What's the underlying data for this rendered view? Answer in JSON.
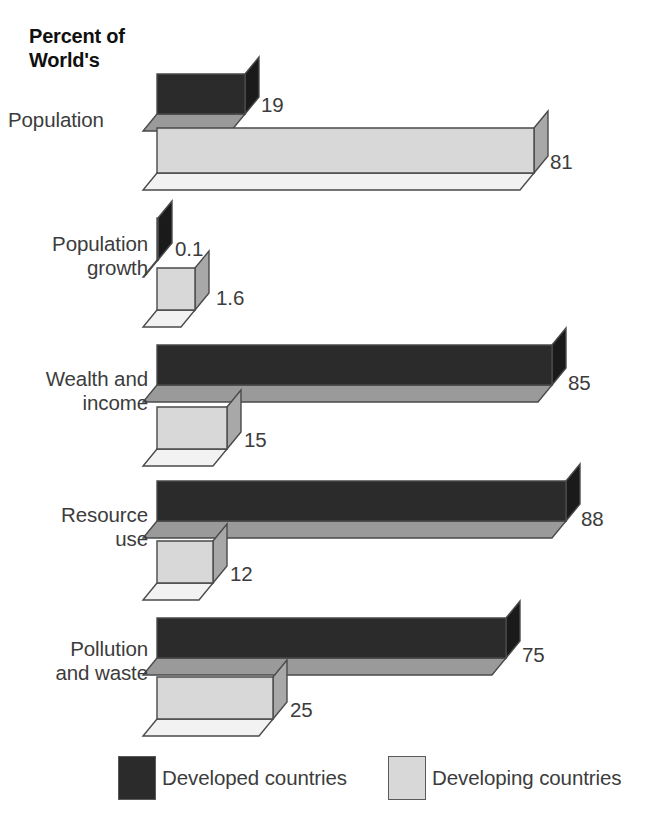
{
  "title": "Percent of\nWorld's",
  "colors": {
    "developed_front": "#2b2b2b",
    "developed_side": "#1a1a1a",
    "developed_bottom": "#9a9a9a",
    "developing_front": "#d8d8d8",
    "developing_side": "#a8a8a8",
    "developing_bottom": "#f2f2f2",
    "outline": "#4a4a4a",
    "text": "#3c3c3c",
    "background": "#ffffff"
  },
  "legend": {
    "items": [
      {
        "label": "Developed countries",
        "swatch": "#2b2b2b",
        "swatch_name": "developed-swatch"
      },
      {
        "label": "Developing countries",
        "swatch": "#d8d8d8",
        "swatch_name": "developing-swatch"
      }
    ]
  },
  "chart_data": {
    "type": "bar",
    "title": "Percent of World's",
    "xlabel": "",
    "ylabel": "",
    "orientation": "horizontal",
    "style": "3d-isometric",
    "grid": false,
    "xlim": [
      0,
      100
    ],
    "legend_position": "bottom",
    "categories": [
      "Population",
      "Population\ngrowth",
      "Wealth and\nincome",
      "Resource\nuse",
      "Pollution\nand waste"
    ],
    "series": [
      {
        "name": "Developed countries",
        "values": [
          19,
          0.1,
          85,
          88,
          75
        ],
        "labels": [
          "19",
          "0.1",
          "85",
          "88",
          "75"
        ]
      },
      {
        "name": "Developing countries",
        "values": [
          81,
          1.6,
          15,
          12,
          25
        ],
        "labels": [
          "81",
          "1.6",
          "15",
          "12",
          "25"
        ]
      }
    ]
  },
  "groups": [
    {
      "label": "Population",
      "label_align": "left",
      "label_top": 108,
      "bars": [
        {
          "series": "developed",
          "value": 19,
          "value_label": "19",
          "top": 74,
          "width": 88,
          "height": 40,
          "label_x": 261,
          "label_y": 95
        },
        {
          "series": "developing",
          "value": 81,
          "value_label": "81",
          "top": 128,
          "width": 377,
          "height": 45,
          "label_x": 550,
          "label_y": 152
        }
      ]
    },
    {
      "label": "Population\ngrowth",
      "label_align": "right",
      "label_top": 232,
      "bars": [
        {
          "series": "developed",
          "value": 0.1,
          "value_label": "0.1",
          "top": 218,
          "width": 1,
          "height": 42,
          "label_x": 175,
          "label_y": 239
        },
        {
          "series": "developing",
          "value": 1.6,
          "value_label": "1.6",
          "top": 268,
          "width": 38,
          "height": 42,
          "label_x": 216,
          "label_y": 288
        }
      ]
    },
    {
      "label": "Wealth and\nincome",
      "label_align": "right",
      "label_top": 367,
      "bars": [
        {
          "series": "developed",
          "value": 85,
          "value_label": "85",
          "top": 345,
          "width": 395,
          "height": 40,
          "label_x": 568,
          "label_y": 373
        },
        {
          "series": "developing",
          "value": 15,
          "value_label": "15",
          "top": 407,
          "width": 70,
          "height": 42,
          "label_x": 244,
          "label_y": 430
        }
      ]
    },
    {
      "label": "Resource\nuse",
      "label_align": "right",
      "label_top": 503,
      "bars": [
        {
          "series": "developed",
          "value": 88,
          "value_label": "88",
          "top": 481,
          "width": 409,
          "height": 40,
          "label_x": 581,
          "label_y": 509
        },
        {
          "series": "developing",
          "value": 12,
          "value_label": "12",
          "top": 541,
          "width": 56,
          "height": 42,
          "label_x": 230,
          "label_y": 564
        }
      ]
    },
    {
      "label": "Pollution\nand waste",
      "label_align": "right",
      "label_top": 637,
      "bars": [
        {
          "series": "developed",
          "value": 75,
          "value_label": "75",
          "top": 618,
          "width": 349,
          "height": 40,
          "label_x": 522,
          "label_y": 645
        },
        {
          "series": "developing",
          "value": 25,
          "value_label": "25",
          "top": 677,
          "width": 116,
          "height": 42,
          "label_x": 290,
          "label_y": 700
        }
      ]
    }
  ],
  "geometry": {
    "bar_origin_x": 157,
    "depth_x": 14,
    "depth_y": 17
  }
}
